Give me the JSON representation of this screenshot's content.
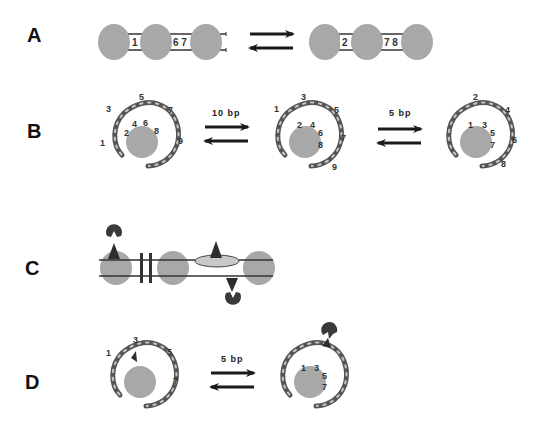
{
  "figure": {
    "panels": [
      {
        "label": "A",
        "left_state": {
          "linker1_numbers": "1",
          "linker2_numbers": "6 7"
        },
        "right_state": {
          "linker1_numbers": "2",
          "linker2_numbers": "7 8"
        }
      },
      {
        "label": "B",
        "states": [
          {
            "outer_numbers": [
              "1",
              "3",
              "5",
              "7",
              "9"
            ],
            "inner_numbers": [
              "2",
              "4",
              "6",
              "8"
            ]
          },
          {
            "outer_numbers": [
              "1",
              "3",
              "5",
              "7",
              "9"
            ],
            "inner_numbers": [
              "2",
              "4",
              "6",
              "8"
            ]
          },
          {
            "outer_numbers": [
              "2",
              "4",
              "6",
              "8"
            ],
            "inner_numbers": [
              "1",
              "3",
              "5",
              "7"
            ]
          }
        ],
        "transitions": [
          "10 bp",
          "5 bp"
        ]
      },
      {
        "label": "C"
      },
      {
        "label": "D",
        "states": [
          {
            "outer_numbers": [
              "1",
              "3",
              "5",
              "7"
            ]
          },
          {
            "inner_numbers": [
              "1",
              "3",
              "5",
              "7"
            ]
          }
        ],
        "transitions": [
          "5 bp"
        ]
      }
    ],
    "colors": {
      "nucleosome": "#a8a8a8",
      "dna_strand": "#555555",
      "dna_highlight": "#bdbdbd",
      "arrow": "#1a1a1a",
      "protein": "#3a3a3a"
    }
  }
}
